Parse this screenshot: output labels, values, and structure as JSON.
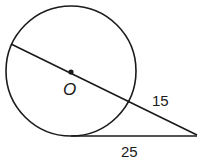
{
  "diagram": {
    "type": "circle-secant-tangent",
    "center_label": "O",
    "labels": {
      "secant_external": "15",
      "tangent": "25"
    },
    "geometry": {
      "circle": {
        "cx": 71,
        "cy": 71,
        "r": 65
      },
      "secant": {
        "x1": 11,
        "y1": 44,
        "x2": 197,
        "y2": 135
      },
      "tangent": {
        "x1": 71,
        "y1": 136,
        "x2": 197,
        "y2": 136
      },
      "external_point": {
        "x": 197,
        "y": 135
      }
    },
    "colors": {
      "stroke": "#1a1a1a",
      "background": "#ffffff"
    }
  }
}
